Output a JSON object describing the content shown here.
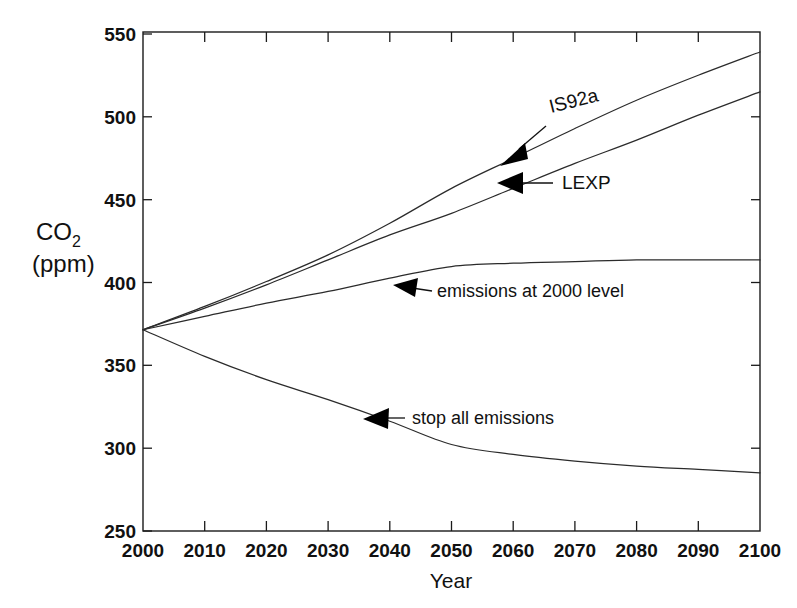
{
  "chart_data": {
    "type": "line",
    "title": "",
    "xlabel": "Year",
    "ylabel": "CO2 (ppm)",
    "ylabel_main": "CO",
    "ylabel_sub": "2",
    "ylabel_units": "(ppm)",
    "xlim": [
      2000,
      2100
    ],
    "ylim": [
      250,
      550
    ],
    "xticks": [
      2000,
      2010,
      2020,
      2030,
      2040,
      2050,
      2060,
      2070,
      2080,
      2090,
      2100
    ],
    "yticks": [
      250,
      300,
      350,
      400,
      450,
      500,
      550
    ],
    "xtick_labels": [
      "2000",
      "2010",
      "2020",
      "2030",
      "2040",
      "2050",
      "2060",
      "2070",
      "2080",
      "2090",
      "2100"
    ],
    "ytick_labels": [
      "250",
      "300",
      "350",
      "400",
      "450",
      "500",
      "550"
    ],
    "grid": false,
    "legend": "none",
    "annotations_style": "inline-arrow-labels",
    "line_color": "#2b2b2b",
    "x": [
      2000,
      2010,
      2020,
      2030,
      2040,
      2050,
      2060,
      2070,
      2080,
      2090,
      2100
    ],
    "series": [
      {
        "name": "IS92a",
        "label": "IS92a",
        "values": [
          371,
          385,
          400,
          416,
          435,
          456,
          474,
          492,
          509,
          524,
          538
        ]
      },
      {
        "name": "LEXP",
        "label": "LEXP",
        "values": [
          371,
          384,
          398,
          413,
          428,
          441,
          456,
          471,
          485,
          500,
          514
        ]
      },
      {
        "name": "emissions at 2000 level",
        "label": "emissions at 2000 level",
        "values": [
          371,
          379,
          387,
          394,
          402,
          409,
          411,
          412,
          413,
          413,
          413
        ]
      },
      {
        "name": "stop all emissions",
        "label": "stop all emissions",
        "values": [
          371,
          355,
          341,
          329,
          316,
          302,
          296,
          292,
          289,
          287,
          285
        ]
      }
    ],
    "annotations": [
      {
        "text": "IS92a",
        "series": "IS92a"
      },
      {
        "text": "LEXP",
        "series": "LEXP"
      },
      {
        "text": "emissions at 2000 level",
        "series": "emissions at 2000 level"
      },
      {
        "text": "stop all emissions",
        "series": "stop all emissions"
      }
    ]
  },
  "axes": {
    "x_title": "Year",
    "y_title_main": "CO",
    "y_title_sub": "2",
    "y_title_units": "(ppm)",
    "ytick_0": "250",
    "ytick_1": "300",
    "ytick_2": "350",
    "ytick_3": "400",
    "ytick_4": "450",
    "ytick_5": "500",
    "ytick_6": "550",
    "xtick_0": "2000",
    "xtick_1": "2010",
    "xtick_2": "2020",
    "xtick_3": "2030",
    "xtick_4": "2040",
    "xtick_5": "2050",
    "xtick_6": "2060",
    "xtick_7": "2070",
    "xtick_8": "2080",
    "xtick_9": "2090",
    "xtick_10": "2100"
  },
  "labels": {
    "is92a": "IS92a",
    "lexp": "LEXP",
    "emissions_2000": "emissions at 2000 level",
    "stop_all": "stop all emissions"
  }
}
